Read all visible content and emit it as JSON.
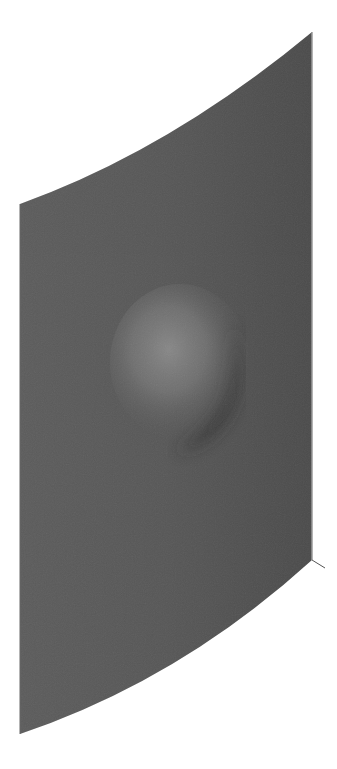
{
  "figure": {
    "colors": {
      "background": "#ffffff",
      "surface": "#555555",
      "surface_dark": "#4a4a4a",
      "highlight": "#8a8a8a",
      "shadow": "#2e2e2e",
      "edge": "#9a9a9a",
      "axis_line": "#555555"
    },
    "surface_corners": {
      "top_left": [
        20,
        204
      ],
      "top_right": [
        312,
        32
      ],
      "bottom_right": [
        312,
        560
      ],
      "bottom_left": [
        20,
        734
      ]
    },
    "bump": {
      "center": [
        185,
        365
      ],
      "radius": 62
    }
  }
}
